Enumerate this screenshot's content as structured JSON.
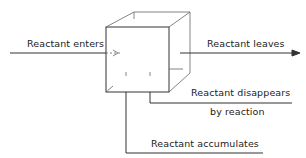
{
  "diagram": {
    "type": "control-volume-balance",
    "element": "cube-control-volume",
    "labels": {
      "enters": "Reactant enters",
      "leaves": "Reactant leaves",
      "disappears_line1": "Reactant disappears",
      "disappears_line2": "by reaction",
      "accumulates": "Reactant accumulates"
    },
    "colors": {
      "line": "#333333",
      "text": "#222222",
      "background": "#ffffff"
    }
  }
}
